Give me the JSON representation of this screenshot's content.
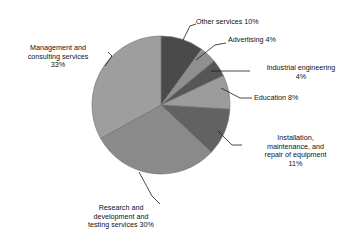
{
  "figure": {
    "title": ""
  },
  "chart_data": {
    "type": "pie",
    "title": "",
    "xlabel": "",
    "ylabel": "",
    "legend_position": "none",
    "grid": false,
    "start_angle_deg": 0,
    "direction": "clockwise",
    "categories": [
      "Other services",
      "Advertising",
      "Industrial engineering",
      "Education",
      "Installation, maintenance, and repair of equipment",
      "Research and development and testing services",
      "Management and consulting services"
    ],
    "values": [
      10,
      4,
      4,
      8,
      11,
      30,
      33
    ],
    "unit": "%",
    "colors": [
      "#4a4a4a",
      "#8f8f8f",
      "#565656",
      "#9c9c9c",
      "#626262",
      "#8a8a8a",
      "#9e9e9e"
    ],
    "slices": [
      {
        "label": "Other services",
        "value": 10,
        "value_text": "10%",
        "color": "#4a4a4a"
      },
      {
        "label": "Advertising",
        "value": 4,
        "value_text": "4%",
        "color": "#8f8f8f"
      },
      {
        "label": "Industrial engineering",
        "value": 4,
        "value_text": "4%",
        "color": "#565656"
      },
      {
        "label": "Education",
        "value": 8,
        "value_text": "8%",
        "color": "#9c9c9c"
      },
      {
        "label": "Installation, maintenance, and repair of equipment",
        "value": 11,
        "value_text": "11%",
        "color": "#626262"
      },
      {
        "label": "Research and development and testing services",
        "value": 30,
        "value_text": "30%",
        "color": "#8a8a8a"
      },
      {
        "label": "Management and consulting services",
        "value": 33,
        "value_text": "33%",
        "color": "#9e9e9e"
      }
    ]
  },
  "labels": {
    "other_services": "Other services 10%",
    "advertising": "Advertising 4%",
    "industrial_engineering": "Industrial engineering\n4%",
    "education": "Education 8%",
    "installation": "Installation,\nmaintenance, and\nrepair of equipment\n11%",
    "research": "Research and\ndevelopment and\ntesting services 30%",
    "management": "Management and\nconsulting services\n33%"
  }
}
